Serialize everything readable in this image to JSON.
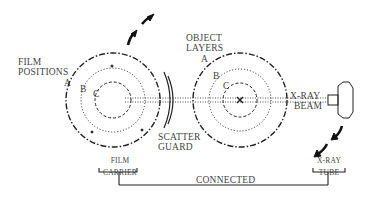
{
  "diagram": {
    "type": "tomography-motion-schematic",
    "labels": {
      "film_positions": [
        "FILM",
        "POSITIONS"
      ],
      "object_layers": [
        "OBJECT",
        "LAYERS"
      ],
      "xray_beam": [
        "X-RAY",
        "BEAM"
      ],
      "scatter_guard": [
        "SCATTER",
        "GUARD"
      ],
      "film_carrier": [
        "FILM",
        "CARRIER"
      ],
      "xray_tube": [
        "X-RAY",
        "TUBE"
      ],
      "connected": "CONNECTED",
      "left_layers": {
        "a": "A",
        "b": "B",
        "c": "C"
      },
      "right_layers": {
        "a": "A",
        "b": "B",
        "c": "C"
      }
    },
    "arrows": {
      "film_motion": "upward-right (clockwise)",
      "tube_motion": "downward-left"
    },
    "colors": {
      "line": "#222222",
      "text": "#444444",
      "background": "#ffffff"
    }
  }
}
